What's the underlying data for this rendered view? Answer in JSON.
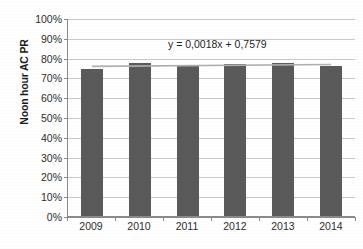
{
  "chart_data": {
    "type": "bar",
    "title": "",
    "xlabel": "",
    "ylabel": "Noon hour AC PR",
    "categories": [
      "2009",
      "2010",
      "2011",
      "2012",
      "2013",
      "2014"
    ],
    "values": [
      0.745,
      0.775,
      0.765,
      0.768,
      0.775,
      0.76
    ],
    "value_labels": [
      "74,5%",
      "77,5%",
      "76,5%",
      "76,8%",
      "77,5%",
      "76,0%"
    ],
    "ylim": [
      0,
      1.0
    ],
    "ytick_labels": [
      "0%",
      "10%",
      "20%",
      "30%",
      "40%",
      "50%",
      "60%",
      "70%",
      "80%",
      "90%",
      "100%"
    ],
    "ytick_values": [
      0,
      0.1,
      0.2,
      0.3,
      0.4,
      0.5,
      0.6,
      0.7,
      0.8,
      0.9,
      1.0
    ],
    "grid": true,
    "legend": "none",
    "annotations": [
      {
        "name": "trendline-equation",
        "text": "y = 0,0018x + 0,7579",
        "slope": 0.0018,
        "intercept": 0.7579
      }
    ],
    "series": [
      {
        "name": "Noon hour AC PR",
        "type": "bar",
        "color": "#5a5a5a",
        "values": [
          0.745,
          0.775,
          0.765,
          0.768,
          0.775,
          0.76
        ]
      },
      {
        "name": "Linear trendline",
        "type": "line",
        "color": "#b0b0b0",
        "values": [
          0.7597,
          0.7615,
          0.7633,
          0.7651,
          0.7669,
          0.7687
        ]
      }
    ]
  },
  "axes": {
    "y_title": "Noon hour AC PR",
    "gridline_color": "#c9c9c9",
    "axis_color": "#8a8a8a"
  },
  "colors": {
    "bar": "#5a5a5a",
    "trendline": "#b0b0b0",
    "background": "#ffffff",
    "text": "#2b2b2b"
  }
}
